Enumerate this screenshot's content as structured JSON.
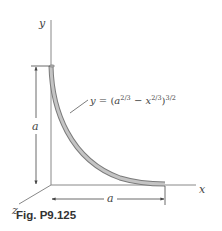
{
  "figure": {
    "caption": "Fig. P9.125",
    "axes": {
      "x_label": "x",
      "y_label": "y",
      "z_label": "z"
    },
    "dimensions": {
      "vertical": "a",
      "horizontal": "a"
    },
    "equation": {
      "lhs": "y",
      "eq": " = (",
      "a": "a",
      "a_exp": "2/3",
      "minus": " − ",
      "x": "x",
      "x_exp": "2/3",
      "close": ")",
      "outer_exp": "3/2"
    },
    "colors": {
      "axis": "#777777",
      "rod_fill": "#b0b0b0",
      "rod_edge": "#7a7a7a",
      "text": "#444444"
    }
  }
}
